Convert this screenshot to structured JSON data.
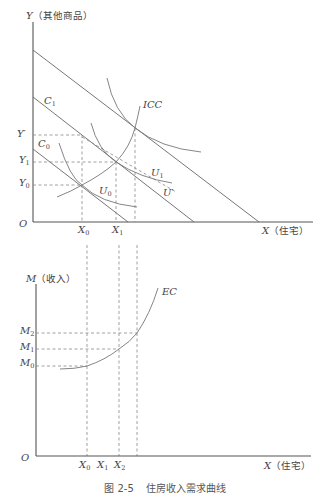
{
  "caption": {
    "number": "图 2-5",
    "title": "住房收入需求曲线"
  },
  "top_chart": {
    "y_axis": {
      "var": "Y",
      "name": "（其他商品）"
    },
    "x_axis": {
      "var": "X",
      "name": "（住宅）"
    },
    "origin": "O",
    "y_ticks": [
      {
        "base": "Y",
        "sub": "′"
      },
      {
        "base": "Y",
        "sub": "1"
      },
      {
        "base": "Y",
        "sub": "0"
      }
    ],
    "x_ticks": [
      {
        "base": "X",
        "sub": "0"
      },
      {
        "base": "X",
        "sub": "1"
      }
    ],
    "budget_lines": [
      {
        "label": "C",
        "sub": "1"
      },
      {
        "label": "C",
        "sub": "0"
      }
    ],
    "curves": {
      "icc": "ICC",
      "u0": {
        "base": "U",
        "sub": "0"
      },
      "u1": {
        "base": "U",
        "sub": "1"
      },
      "uprime": {
        "base": "U",
        "sub": "′"
      }
    }
  },
  "bottom_chart": {
    "y_axis": {
      "var": "M",
      "name": "（收入）"
    },
    "x_axis": {
      "var": "X",
      "name": "（住宅）"
    },
    "origin": "O",
    "y_ticks": [
      {
        "base": "M",
        "sub": "2"
      },
      {
        "base": "M",
        "sub": "1"
      },
      {
        "base": "M",
        "sub": "0"
      }
    ],
    "x_ticks": [
      {
        "base": "X",
        "sub": "0"
      },
      {
        "base": "X",
        "sub": "1"
      },
      {
        "base": "X",
        "sub": "2"
      }
    ],
    "curve": "EC"
  },
  "colors": {
    "axis": "#555555",
    "line": "#666666",
    "dash": "#888888",
    "text": "#444444"
  }
}
